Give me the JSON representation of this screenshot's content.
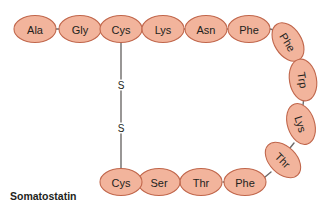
{
  "figure": {
    "caption": "Somatostatin",
    "caption_x": 10,
    "caption_y": 196,
    "background_color": "#ffffff"
  },
  "style": {
    "ellipse_fill": "#f2b49c",
    "ellipse_stroke": "#c0664b",
    "label_color": "#231f20",
    "bond_color": "#6d6a69",
    "disulfide_color": "#6d6a69",
    "sulfur_color": "#231f20",
    "caption_color": "#231f20"
  },
  "residues": [
    {
      "id": "ala-1",
      "label": "Ala",
      "cx": 35,
      "cy": 29,
      "rx": 21,
      "ry": 13.5,
      "rotation": 0
    },
    {
      "id": "gly-2",
      "label": "Gly",
      "cx": 80,
      "cy": 29,
      "rx": 21,
      "ry": 13.5,
      "rotation": 0
    },
    {
      "id": "cys-3",
      "label": "Cys",
      "cx": 121,
      "cy": 29,
      "rx": 21,
      "ry": 13.5,
      "rotation": 0
    },
    {
      "id": "lys-4",
      "label": "Lys",
      "cx": 163,
      "cy": 29,
      "rx": 21,
      "ry": 13.5,
      "rotation": 0
    },
    {
      "id": "asn-5",
      "label": "Asn",
      "cx": 206,
      "cy": 29,
      "rx": 21,
      "ry": 13.5,
      "rotation": 0
    },
    {
      "id": "phe-6",
      "label": "Phe",
      "cx": 249,
      "cy": 29,
      "rx": 21,
      "ry": 13.5,
      "rotation": 0
    },
    {
      "id": "phe-7",
      "label": "Phe",
      "cx": 288,
      "cy": 42,
      "rx": 21,
      "ry": 13.5,
      "rotation": 58
    },
    {
      "id": "trp-8",
      "label": "Trp",
      "cx": 303,
      "cy": 80,
      "rx": 21,
      "ry": 13.5,
      "rotation": 80
    },
    {
      "id": "lys-9",
      "label": "Lys",
      "cx": 301,
      "cy": 124,
      "rx": 21,
      "ry": 13.5,
      "rotation": 72
    },
    {
      "id": "thr-10",
      "label": "Thr",
      "cx": 283,
      "cy": 160,
      "rx": 21,
      "ry": 13.5,
      "rotation": 45
    },
    {
      "id": "phe-11",
      "label": "Phe",
      "cx": 245,
      "cy": 182,
      "rx": 21,
      "ry": 13.5,
      "rotation": 0
    },
    {
      "id": "thr-12",
      "label": "Thr",
      "cx": 201,
      "cy": 182,
      "rx": 21,
      "ry": 13.5,
      "rotation": 0
    },
    {
      "id": "ser-13",
      "label": "Ser",
      "cx": 159,
      "cy": 182,
      "rx": 21,
      "ry": 13.5,
      "rotation": 0
    },
    {
      "id": "cys-14",
      "label": "Cys",
      "cx": 121,
      "cy": 182,
      "rx": 21,
      "ry": 13.5,
      "rotation": 0
    }
  ],
  "bonds": [
    {
      "id": "bond-ala-gly",
      "x1": 56,
      "y1": 29,
      "x2": 59,
      "y2": 29
    },
    {
      "id": "bond-gly-cys",
      "x1": 101,
      "y1": 29,
      "x2": 100,
      "y2": 29
    },
    {
      "id": "bond-cys-lys",
      "x1": 142,
      "y1": 29,
      "x2": 142,
      "y2": 29
    },
    {
      "id": "bond-lys-asn",
      "x1": 184,
      "y1": 29,
      "x2": 185,
      "y2": 29
    },
    {
      "id": "bond-asn-phe",
      "x1": 227,
      "y1": 29,
      "x2": 228,
      "y2": 29
    },
    {
      "id": "bond-phe-phe",
      "x1": 270,
      "y1": 29,
      "x2": 278,
      "y2": 31
    },
    {
      "id": "bond-phe-trp",
      "x1": 297,
      "y1": 56,
      "x2": 301,
      "y2": 64
    },
    {
      "id": "bond-trp-lys",
      "x1": 304,
      "y1": 97,
      "x2": 303,
      "y2": 105
    },
    {
      "id": "bond-lys-thr",
      "x1": 294,
      "y1": 143,
      "x2": 290,
      "y2": 148
    },
    {
      "id": "bond-thr-phe",
      "x1": 271,
      "y1": 172,
      "x2": 265,
      "y2": 177
    },
    {
      "id": "bond-phe-thr2",
      "x1": 224,
      "y1": 182,
      "x2": 223,
      "y2": 182
    },
    {
      "id": "bond-thr2-ser",
      "x1": 180,
      "y1": 182,
      "x2": 181,
      "y2": 182
    },
    {
      "id": "bond-ser-cys",
      "x1": 138,
      "y1": 182,
      "x2": 143,
      "y2": 182
    }
  ],
  "disulfide": {
    "id": "disulfide-bridge",
    "x": 121,
    "top_y": 43,
    "bottom_y": 168,
    "segments": [
      {
        "x1": 121,
        "y1": 43,
        "x2": 121,
        "y2": 79
      },
      {
        "x1": 121,
        "y1": 91,
        "x2": 121,
        "y2": 122
      },
      {
        "x1": 121,
        "y1": 134,
        "x2": 121,
        "y2": 168
      }
    ],
    "sulfur_labels": [
      {
        "text": "S",
        "x": 121,
        "y": 85
      },
      {
        "text": "S",
        "x": 121,
        "y": 128
      }
    ]
  }
}
